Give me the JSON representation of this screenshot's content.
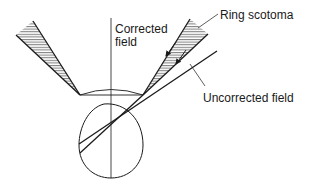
{
  "diagram": {
    "labels": {
      "corrected_field_line1": "Corrected",
      "corrected_field_line2": "field",
      "ring_scotoma": "Ring scotoma",
      "uncorrected_field": "Uncorrected field"
    },
    "colors": {
      "line": "#1a1a1a",
      "background": "#ffffff",
      "hatch": "#333333"
    }
  }
}
